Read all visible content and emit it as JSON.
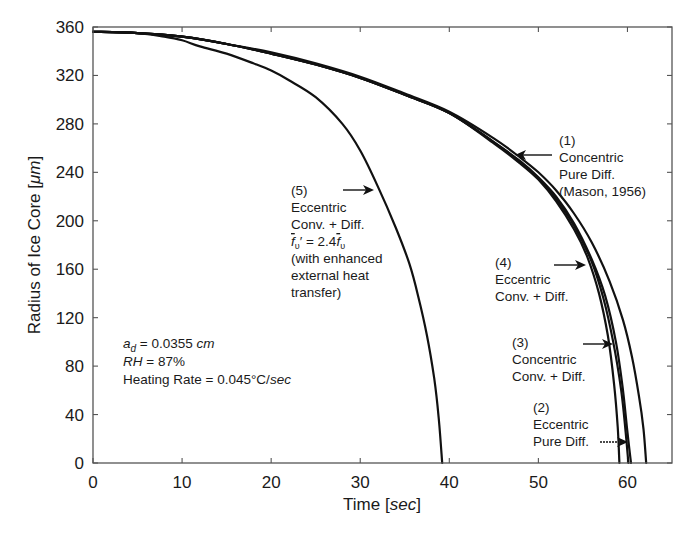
{
  "chart_data": {
    "type": "line",
    "title": "",
    "xlabel": "Time [sec]",
    "xlabel_parts": [
      "Time [",
      "sec",
      "]"
    ],
    "ylabel": "Radius of Ice Core [μm]",
    "ylabel_parts": [
      "Radius of Ice Core [",
      "μm",
      "]"
    ],
    "xlim": [
      0,
      65
    ],
    "ylim": [
      0,
      360
    ],
    "xticks": [
      0,
      10,
      20,
      30,
      40,
      50,
      60
    ],
    "yticks": [
      0,
      40,
      80,
      120,
      160,
      200,
      240,
      280,
      320,
      360
    ],
    "grid": false,
    "legend": "none (inline annotations with arrows)",
    "series": [
      {
        "name": "(1) Concentric Pure Diff. (Mason, 1956)",
        "points": [
          [
            0,
            356
          ],
          [
            5,
            355
          ],
          [
            10,
            352
          ],
          [
            15,
            346
          ],
          [
            20,
            339
          ],
          [
            25,
            330
          ],
          [
            30,
            319
          ],
          [
            35,
            305
          ],
          [
            40,
            290
          ],
          [
            45,
            268
          ],
          [
            48,
            252
          ],
          [
            50,
            240
          ],
          [
            52,
            225
          ],
          [
            54,
            206
          ],
          [
            56,
            182
          ],
          [
            58,
            150
          ],
          [
            59.5,
            118
          ],
          [
            60.5,
            88
          ],
          [
            61.3,
            55
          ],
          [
            61.8,
            28
          ],
          [
            62.1,
            0
          ]
        ]
      },
      {
        "name": "(2) Eccentric Pure Diff.",
        "points": [
          [
            0,
            356
          ],
          [
            5,
            355
          ],
          [
            10,
            352
          ],
          [
            15,
            346
          ],
          [
            20,
            338
          ],
          [
            25,
            329
          ],
          [
            30,
            318
          ],
          [
            35,
            304
          ],
          [
            40,
            289
          ],
          [
            45,
            265
          ],
          [
            48,
            249
          ],
          [
            50,
            236
          ],
          [
            52,
            220
          ],
          [
            54,
            198
          ],
          [
            56,
            168
          ],
          [
            57.5,
            138
          ],
          [
            58.7,
            100
          ],
          [
            59.5,
            60
          ],
          [
            60,
            25
          ],
          [
            60.4,
            0
          ]
        ]
      },
      {
        "name": "(3) Concentric Conv. + Diff.",
        "points": [
          [
            0,
            356
          ],
          [
            5,
            355
          ],
          [
            10,
            352
          ],
          [
            15,
            346
          ],
          [
            20,
            338
          ],
          [
            25,
            329
          ],
          [
            30,
            318
          ],
          [
            35,
            304
          ],
          [
            40,
            289
          ],
          [
            45,
            265
          ],
          [
            48,
            248
          ],
          [
            50,
            235
          ],
          [
            52,
            218
          ],
          [
            54,
            196
          ],
          [
            56,
            166
          ],
          [
            57.3,
            136
          ],
          [
            58.4,
            100
          ],
          [
            59.3,
            60
          ],
          [
            59.8,
            25
          ],
          [
            60.1,
            0
          ]
        ]
      },
      {
        "name": "(4) Eccentric Conv. + Diff.",
        "points": [
          [
            0,
            356
          ],
          [
            5,
            355
          ],
          [
            10,
            352
          ],
          [
            15,
            346
          ],
          [
            20,
            338
          ],
          [
            25,
            329
          ],
          [
            30,
            318
          ],
          [
            35,
            304
          ],
          [
            40,
            289
          ],
          [
            45,
            264
          ],
          [
            48,
            247
          ],
          [
            50,
            234
          ],
          [
            52,
            216
          ],
          [
            54,
            193
          ],
          [
            55.5,
            170
          ],
          [
            56.8,
            140
          ],
          [
            57.8,
            105
          ],
          [
            58.5,
            65
          ],
          [
            58.9,
            30
          ],
          [
            59.1,
            0
          ]
        ]
      },
      {
        "name": "(5) Eccentric Conv. + Diff. f̄ᵥ′ = 2.4f̄ᵥ (with enhanced external heat transfer)",
        "points": [
          [
            0,
            356
          ],
          [
            5,
            355
          ],
          [
            8,
            352
          ],
          [
            10,
            349
          ],
          [
            12,
            344
          ],
          [
            15,
            338
          ],
          [
            18,
            330
          ],
          [
            20,
            324
          ],
          [
            22,
            316
          ],
          [
            25,
            302
          ],
          [
            28,
            280
          ],
          [
            30,
            258
          ],
          [
            32,
            228
          ],
          [
            34,
            194
          ],
          [
            35.5,
            165
          ],
          [
            36.5,
            138
          ],
          [
            37.5,
            105
          ],
          [
            38.3,
            70
          ],
          [
            38.8,
            38
          ],
          [
            39.2,
            0
          ]
        ]
      }
    ],
    "annotations": [
      {
        "lines": [
          "(1)",
          "Concentric",
          "Pure Diff.",
          "(Mason, 1956)"
        ],
        "arrow_to": [
          47.5,
          253
        ]
      },
      {
        "lines": [
          "(2)",
          "Eccentric",
          "Pure Diff."
        ],
        "arrow_to": [
          60.2,
          18
        ]
      },
      {
        "lines": [
          "(3)",
          "Concentric",
          "Conv. + Diff."
        ],
        "arrow_to": [
          58.8,
          97
        ]
      },
      {
        "lines": [
          "(4)",
          "Eccentric",
          "Conv. + Diff."
        ],
        "arrow_to": [
          55.5,
          163
        ]
      },
      {
        "lines": [
          "(5)",
          "Eccentric",
          "Conv. + Diff.",
          "f̄ᵥ′ = 2.4f̄ᵥ",
          "(with enhanced",
          "external heat",
          "transfer)"
        ],
        "arrow_to": [
          31.6,
          225
        ]
      },
      {
        "lines": [
          "a_d = 0.0355 cm",
          "RH = 87%",
          "Heating Rate = 0.045°C/sec"
        ]
      }
    ]
  },
  "params_box": {
    "ad_sym": "a",
    "ad_sub": "d",
    "ad_val": " = 0.0355 ",
    "ad_unit": "cm",
    "rh_sym": "RH",
    "rh_val": " = 87%",
    "hr_label": "Heating Rate = 0.045°C/",
    "hr_unit": "sec"
  },
  "labels": {
    "c1": [
      "(1)",
      "Concentric",
      "Pure Diff.",
      "(Mason, 1956)"
    ],
    "c2": [
      "(2)",
      "Eccentric",
      "Pure Diff."
    ],
    "c3": [
      "(3)",
      "Concentric",
      "Conv. + Diff."
    ],
    "c4": [
      "(4)",
      "Eccentric",
      "Conv. + Diff."
    ],
    "c5": [
      "(5)",
      "Eccentric",
      "Conv. + Diff.",
      "f",
      "υ",
      "′ = 2.4",
      "f",
      "υ",
      "(with enhanced",
      "external heat",
      "transfer)"
    ]
  }
}
